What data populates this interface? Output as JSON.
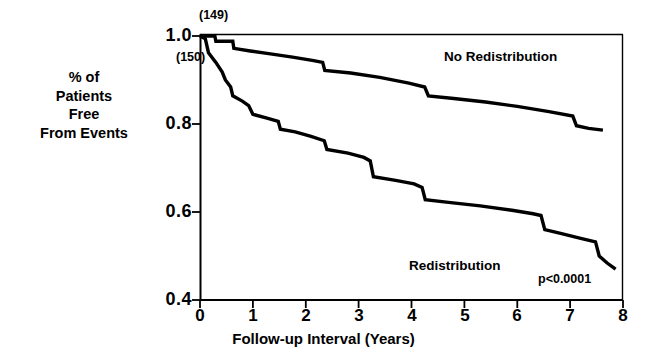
{
  "chart_data": {
    "type": "line",
    "title": "",
    "subtitle": "",
    "xlabel": "Follow-up Interval (Years)",
    "ylabel": "% of Patients Free From Events",
    "xlim": [
      0,
      8
    ],
    "ylim": [
      0.4,
      1.0
    ],
    "xticks": [
      "0",
      "1",
      "2",
      "3",
      "4",
      "5",
      "6",
      "7",
      "8"
    ],
    "yticks": [
      "1.0",
      "0.8",
      "0.6",
      "0.4"
    ],
    "grid": false,
    "legend_position": "inline-annotations",
    "curve_style": "kaplan-meier-step",
    "line_color": "#000000",
    "annotations": [
      {
        "name": "no-redistribution-n",
        "text": "(149)",
        "x": 0.02,
        "y": 1.02
      },
      {
        "name": "redistribution-n",
        "text": "(150)",
        "x": -0.45,
        "y": 0.94
      },
      {
        "name": "p-value",
        "text": "p<0.0001",
        "x": 6.4,
        "y": 0.452
      }
    ],
    "series": [
      {
        "name": "No Redistribution",
        "label": "No Redistribution",
        "n": 149,
        "label_x": 5.6,
        "label_y": 0.935,
        "points": [
          [
            0.0,
            1.0
          ],
          [
            0.28,
            1.0
          ],
          [
            0.3,
            0.988
          ],
          [
            0.62,
            0.988
          ],
          [
            0.64,
            0.972
          ],
          [
            0.95,
            0.966
          ],
          [
            1.3,
            0.96
          ],
          [
            1.75,
            0.952
          ],
          [
            2.15,
            0.944
          ],
          [
            2.32,
            0.94
          ],
          [
            2.36,
            0.922
          ],
          [
            2.85,
            0.916
          ],
          [
            3.4,
            0.906
          ],
          [
            3.95,
            0.893
          ],
          [
            4.25,
            0.884
          ],
          [
            4.32,
            0.864
          ],
          [
            4.8,
            0.858
          ],
          [
            5.4,
            0.85
          ],
          [
            6.0,
            0.84
          ],
          [
            6.6,
            0.828
          ],
          [
            7.05,
            0.818
          ],
          [
            7.12,
            0.796
          ],
          [
            7.35,
            0.79
          ],
          [
            7.62,
            0.786
          ]
        ]
      },
      {
        "name": "Redistribution",
        "label": "Redistribution",
        "n": 150,
        "label_x": 3.95,
        "label_y": 0.487,
        "points": [
          [
            0.0,
            1.0
          ],
          [
            0.1,
            0.994
          ],
          [
            0.16,
            0.962
          ],
          [
            0.3,
            0.94
          ],
          [
            0.42,
            0.918
          ],
          [
            0.48,
            0.9
          ],
          [
            0.58,
            0.884
          ],
          [
            0.62,
            0.864
          ],
          [
            0.8,
            0.852
          ],
          [
            0.92,
            0.842
          ],
          [
            1.0,
            0.822
          ],
          [
            1.25,
            0.814
          ],
          [
            1.48,
            0.806
          ],
          [
            1.52,
            0.788
          ],
          [
            1.8,
            0.782
          ],
          [
            2.1,
            0.772
          ],
          [
            2.35,
            0.762
          ],
          [
            2.4,
            0.742
          ],
          [
            2.8,
            0.734
          ],
          [
            3.1,
            0.724
          ],
          [
            3.22,
            0.716
          ],
          [
            3.28,
            0.68
          ],
          [
            3.7,
            0.672
          ],
          [
            4.05,
            0.664
          ],
          [
            4.2,
            0.656
          ],
          [
            4.26,
            0.628
          ],
          [
            4.7,
            0.622
          ],
          [
            5.3,
            0.614
          ],
          [
            5.9,
            0.604
          ],
          [
            6.3,
            0.596
          ],
          [
            6.45,
            0.592
          ],
          [
            6.52,
            0.56
          ],
          [
            6.8,
            0.552
          ],
          [
            7.2,
            0.54
          ],
          [
            7.48,
            0.532
          ],
          [
            7.55,
            0.5
          ],
          [
            7.7,
            0.484
          ],
          [
            7.86,
            0.47
          ]
        ]
      }
    ]
  },
  "axes": {
    "x_title": "Follow-up Interval (Years)",
    "y_title_lines": [
      "% of",
      "Patients",
      "Free",
      "From Events"
    ],
    "x_tick_labels": [
      "0",
      "1",
      "2",
      "3",
      "4",
      "5",
      "6",
      "7",
      "8"
    ],
    "y_tick_labels": [
      "1.0",
      "0.8",
      "0.6",
      "0.4"
    ]
  },
  "labels": {
    "no_redistribution": "No Redistribution",
    "redistribution": "Redistribution",
    "p_value": "p<0.0001",
    "n_no_redistribution": "(149)",
    "n_redistribution": "(150)"
  },
  "colors": {
    "line": "#000000",
    "axis": "#000000",
    "background": "#ffffff"
  }
}
